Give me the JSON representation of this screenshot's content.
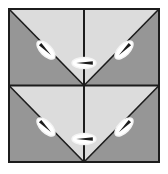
{
  "figure": {
    "type": "geometric-tiling",
    "canvas": {
      "width": 168,
      "height": 174
    },
    "frame": {
      "x": 9,
      "y": 9,
      "width": 150,
      "height": 153,
      "stroke_color": "#1c1c1c",
      "stroke_width": 2,
      "background_color": "#ffffff"
    },
    "colors": {
      "light_gray": "#dcdcdc",
      "dark_gray": "#969696",
      "line": "#1c1c1c",
      "marker_fill": "#ffffff",
      "marker_stroke": "#1c1c1c",
      "page_background": "#ffffff"
    },
    "grid": {
      "columns": 2,
      "rows": 2,
      "cell_width": 75,
      "cell_height": 76.5,
      "vertical_divider_x": 84,
      "horizontal_divider_y": 85.5,
      "divider_color": "#1c1c1c",
      "divider_width": 2
    },
    "cells": [
      {
        "id": "cell-top-left",
        "row": 0,
        "column": 0,
        "x": 9,
        "y": 9,
        "width": 75,
        "height": 76.5,
        "diagonal": "top-left-to-bottom-right",
        "light_region": "upper-right",
        "dark_region": "lower-left",
        "light_points": "9,9 84,9 84,85.5",
        "dark_points": "9,9 84,85.5 9,85.5"
      },
      {
        "id": "cell-top-right",
        "row": 0,
        "column": 1,
        "x": 84,
        "y": 9,
        "width": 75,
        "height": 76.5,
        "diagonal": "top-right-to-bottom-left",
        "light_region": "upper-left",
        "dark_region": "lower-right",
        "light_points": "84,9 159,9 84,85.5",
        "dark_points": "159,9 159,85.5 84,85.5"
      },
      {
        "id": "cell-bottom-left",
        "row": 1,
        "column": 0,
        "x": 9,
        "y": 85.5,
        "width": 75,
        "height": 76.5,
        "diagonal": "top-left-to-bottom-right",
        "light_region": "upper-right",
        "dark_region": "lower-left",
        "light_points": "9,85.5 84,85.5 84,162",
        "dark_points": "9,85.5 84,162 9,162"
      },
      {
        "id": "cell-bottom-right",
        "row": 1,
        "column": 1,
        "x": 84,
        "y": 85.5,
        "width": 75,
        "height": 76.5,
        "diagonal": "top-right-to-bottom-left",
        "light_region": "upper-left",
        "dark_region": "lower-right",
        "light_points": "84,85.5 159,85.5 84,162",
        "dark_points": "159,85.5 159,162 84,162"
      }
    ],
    "markers": [
      {
        "id": "marker-top-left",
        "label": "top-left diagonal marker",
        "cx": 46,
        "cy": 50,
        "rx": 11.5,
        "ry": 5.5,
        "rotation": 45,
        "arrow_direction": "down-right",
        "orientation": "nw-se"
      },
      {
        "id": "marker-top-center",
        "label": "top-center horizontal marker",
        "cx": 84,
        "cy": 63,
        "rx": 12,
        "ry": 5.5,
        "rotation": 0,
        "arrow_direction": "left",
        "orientation": "horizontal"
      },
      {
        "id": "marker-top-right",
        "label": "top-right diagonal marker",
        "cx": 124,
        "cy": 50,
        "rx": 11.5,
        "ry": 5.5,
        "rotation": -45,
        "arrow_direction": "down-left",
        "orientation": "ne-sw"
      },
      {
        "id": "marker-bottom-left",
        "label": "bottom-left diagonal marker",
        "cx": 46,
        "cy": 127,
        "rx": 11.5,
        "ry": 5.5,
        "rotation": 45,
        "arrow_direction": "down-right",
        "orientation": "nw-se"
      },
      {
        "id": "marker-bottom-center",
        "label": "bottom-center horizontal marker",
        "cx": 84,
        "cy": 139,
        "rx": 12,
        "ry": 5.5,
        "rotation": 0,
        "arrow_direction": "left",
        "orientation": "horizontal"
      },
      {
        "id": "marker-bottom-right",
        "label": "bottom-right diagonal marker",
        "cx": 124,
        "cy": 127,
        "rx": 11.5,
        "ry": 5.5,
        "rotation": -45,
        "arrow_direction": "down-left",
        "orientation": "ne-sw"
      }
    ]
  }
}
